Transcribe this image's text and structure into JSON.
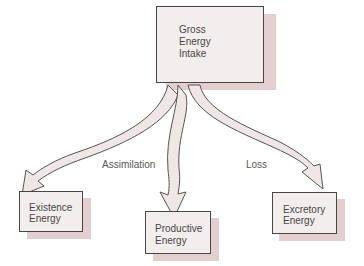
{
  "diagram": {
    "nodes": [
      {
        "id": "gross",
        "lines": [
          "Gross",
          "Energy",
          "Intake"
        ]
      },
      {
        "id": "existence",
        "lines": [
          "Existence",
          "Energy"
        ]
      },
      {
        "id": "productive",
        "lines": [
          "Productive",
          "Energy"
        ]
      },
      {
        "id": "excretory",
        "lines": [
          "Excretory",
          "Energy"
        ]
      }
    ],
    "edges": [
      {
        "from": "gross",
        "to": "existence",
        "label": "Assimilation"
      },
      {
        "from": "gross",
        "to": "productive",
        "label": ""
      },
      {
        "from": "gross",
        "to": "excretory",
        "label": "Loss"
      }
    ],
    "colors": {
      "box_fill": "#f3eeee",
      "box_border": "#4a4444",
      "shadow": "#e3cfcf",
      "arrow_fill": "#efe6e6",
      "text": "#4b4545"
    }
  }
}
